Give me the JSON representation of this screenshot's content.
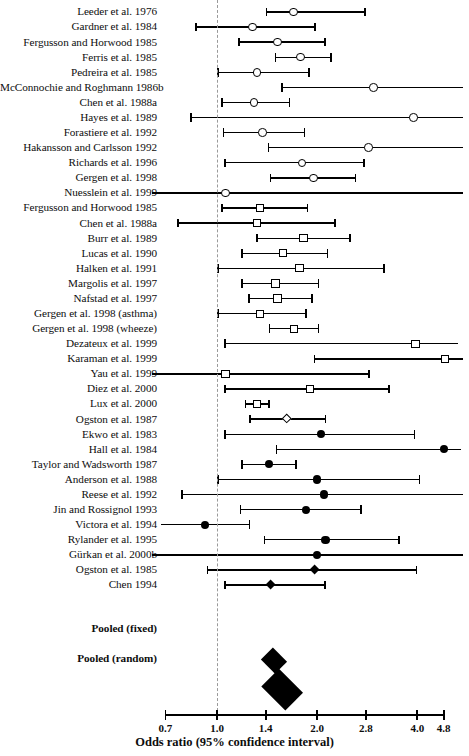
{
  "chart_data": {
    "type": "forest",
    "title": "",
    "xlabel": "Odds ratio (95% confidence interval)",
    "ylabel": "",
    "scale": "log",
    "xlim": [
      0.7,
      4.8
    ],
    "null_value": 1.0,
    "grid": false,
    "legend": "none",
    "tick_labels": [
      "0.7",
      "1.0",
      "1.4",
      "2.0",
      "2.8",
      "4.0",
      "4.8"
    ],
    "tick_values": [
      0.7,
      1.0,
      1.4,
      2.0,
      2.8,
      4.0,
      4.8
    ],
    "marker_shapes": {
      "open-circle": "group 1 studies",
      "open-square": "group 2 studies",
      "open-diamond": "group 3 studies",
      "filled-circle": "group 4 studies",
      "filled-diamond": "group 5 studies"
    },
    "studies": [
      {
        "label": "Leeder et al. 1976",
        "or": 1.7,
        "lo": 1.4,
        "hi": 2.8,
        "marker": "open-circle",
        "lo_clipped": false,
        "hi_clipped": false
      },
      {
        "label": "Gardner et al. 1984",
        "or": 1.28,
        "lo": 0.86,
        "hi": 1.98,
        "marker": "open-circle",
        "lo_clipped": false,
        "hi_clipped": false
      },
      {
        "label": "Fergusson and Horwood 1985",
        "or": 1.52,
        "lo": 1.16,
        "hi": 2.12,
        "marker": "open-circle",
        "lo_clipped": false,
        "hi_clipped": false
      },
      {
        "label": "Ferris et al. 1985",
        "or": 1.78,
        "lo": 1.49,
        "hi": 2.21,
        "marker": "open-circle",
        "lo_clipped": false,
        "hi_clipped": false
      },
      {
        "label": "Pedreira et al. 1985",
        "or": 1.32,
        "lo": 1.0,
        "hi": 1.9,
        "marker": "open-circle",
        "lo_clipped": false,
        "hi_clipped": false
      },
      {
        "label": "McConnochie and Roghmann 1986b",
        "or": 2.95,
        "lo": 1.56,
        "hi": 5.5,
        "marker": "open-circle",
        "lo_clipped": false,
        "hi_clipped": true
      },
      {
        "label": "Chen et al. 1988a",
        "or": 1.29,
        "lo": 1.03,
        "hi": 1.66,
        "marker": "open-circle",
        "lo_clipped": false,
        "hi_clipped": false
      },
      {
        "label": "Hayes et al. 1989",
        "or": 3.9,
        "lo": 0.83,
        "hi": 5.5,
        "marker": "open-circle",
        "lo_clipped": false,
        "hi_clipped": true
      },
      {
        "label": "Forastiere et al. 1992",
        "or": 1.37,
        "lo": 1.04,
        "hi": 1.84,
        "marker": "open-circle",
        "lo_clipped": false,
        "hi_clipped": false
      },
      {
        "label": "Hakansson and Carlsson 1992",
        "or": 2.85,
        "lo": 1.42,
        "hi": 5.5,
        "marker": "open-circle",
        "lo_clipped": false,
        "hi_clipped": true
      },
      {
        "label": "Richards et al. 1996",
        "or": 1.8,
        "lo": 1.05,
        "hi": 2.78,
        "marker": "open-circle",
        "lo_clipped": false,
        "hi_clipped": false
      },
      {
        "label": "Gergen et al. 1998",
        "or": 1.95,
        "lo": 1.44,
        "hi": 2.62,
        "marker": "open-circle",
        "lo_clipped": false,
        "hi_clipped": false
      },
      {
        "label": "Nuesslein et al. 1999",
        "or": 1.06,
        "lo": 0.55,
        "hi": 5.5,
        "marker": "open-circle",
        "lo_clipped": true,
        "hi_clipped": true
      },
      {
        "label": "Fergusson and Horwood 1985",
        "or": 1.35,
        "lo": 1.03,
        "hi": 1.88,
        "marker": "open-square",
        "lo_clipped": false,
        "hi_clipped": false
      },
      {
        "label": "Chen et al. 1988a",
        "or": 1.32,
        "lo": 0.76,
        "hi": 2.28,
        "marker": "open-square",
        "lo_clipped": false,
        "hi_clipped": false
      },
      {
        "label": "Burr et al. 1989",
        "or": 1.82,
        "lo": 1.31,
        "hi": 2.52,
        "marker": "open-square",
        "lo_clipped": false,
        "hi_clipped": false
      },
      {
        "label": "Lucas et al. 1990",
        "or": 1.58,
        "lo": 1.18,
        "hi": 2.16,
        "marker": "open-square",
        "lo_clipped": false,
        "hi_clipped": false
      },
      {
        "label": "Halken et al. 1991",
        "or": 1.77,
        "lo": 1.0,
        "hi": 3.2,
        "marker": "open-square",
        "lo_clipped": false,
        "hi_clipped": false
      },
      {
        "label": "Margolis et al. 1997",
        "or": 1.5,
        "lo": 1.18,
        "hi": 2.03,
        "marker": "open-square",
        "lo_clipped": false,
        "hi_clipped": false
      },
      {
        "label": "Nafstad et al. 1997",
        "or": 1.52,
        "lo": 1.24,
        "hi": 1.94,
        "marker": "open-square",
        "lo_clipped": false,
        "hi_clipped": false
      },
      {
        "label": "Gergen et al. 1998 (asthma)",
        "or": 1.35,
        "lo": 1.0,
        "hi": 1.86,
        "marker": "open-square",
        "lo_clipped": false,
        "hi_clipped": false
      },
      {
        "label": "Gergen et al. 1998 (wheeze)",
        "or": 1.7,
        "lo": 1.43,
        "hi": 2.03,
        "marker": "open-square",
        "lo_clipped": false,
        "hi_clipped": false
      },
      {
        "label": "Dezateux et al. 1999",
        "or": 3.95,
        "lo": 1.05,
        "hi": 5.3,
        "marker": "open-square",
        "lo_clipped": false,
        "hi_clipped": true
      },
      {
        "label": "Karaman et al. 1999",
        "or": 4.85,
        "lo": 1.95,
        "hi": 5.5,
        "marker": "open-square",
        "lo_clipped": false,
        "hi_clipped": true
      },
      {
        "label": "Yau et al. 1999",
        "or": 1.06,
        "lo": 0.55,
        "hi": 2.88,
        "marker": "open-square",
        "lo_clipped": true,
        "hi_clipped": false
      },
      {
        "label": "Diez et al. 2000",
        "or": 1.9,
        "lo": 1.05,
        "hi": 3.3,
        "marker": "open-square",
        "lo_clipped": false,
        "hi_clipped": false
      },
      {
        "label": "Lux et al. 2000",
        "or": 1.32,
        "lo": 1.21,
        "hi": 1.44,
        "marker": "open-square",
        "lo_clipped": false,
        "hi_clipped": false
      },
      {
        "label": "Ogston et al. 1987",
        "or": 1.62,
        "lo": 1.25,
        "hi": 2.13,
        "marker": "open-diamond",
        "lo_clipped": false,
        "hi_clipped": false
      },
      {
        "label": "Ekwo et al. 1983",
        "or": 2.05,
        "lo": 1.05,
        "hi": 3.95,
        "marker": "filled-circle",
        "lo_clipped": false,
        "hi_clipped": false
      },
      {
        "label": "Hall et al. 1984",
        "or": 4.8,
        "lo": 1.5,
        "hi": 5.4,
        "marker": "filled-circle",
        "lo_clipped": false,
        "hi_clipped": true
      },
      {
        "label": "Taylor and Wadsworth 1987",
        "or": 1.43,
        "lo": 1.18,
        "hi": 1.74,
        "marker": "filled-circle",
        "lo_clipped": false,
        "hi_clipped": false
      },
      {
        "label": "Anderson et al. 1988",
        "or": 2.0,
        "lo": 1.0,
        "hi": 4.08,
        "marker": "filled-circle",
        "lo_clipped": false,
        "hi_clipped": false
      },
      {
        "label": "Reese et al. 1992",
        "or": 2.1,
        "lo": 0.78,
        "hi": 5.5,
        "marker": "filled-circle",
        "lo_clipped": false,
        "hi_clipped": true
      },
      {
        "label": "Jin and Rossignol 1993",
        "or": 1.85,
        "lo": 1.17,
        "hi": 2.72,
        "marker": "filled-circle",
        "lo_clipped": false,
        "hi_clipped": false
      },
      {
        "label": "Victora et al. 1994",
        "or": 0.92,
        "lo": 0.68,
        "hi": 1.26,
        "marker": "filled-circle",
        "lo_clipped": true,
        "hi_clipped": false
      },
      {
        "label": "Rylander et al. 1995",
        "or": 2.12,
        "lo": 1.38,
        "hi": 3.55,
        "marker": "filled-circle",
        "lo_clipped": false,
        "hi_clipped": false
      },
      {
        "label": "Gürkan et al. 2000b",
        "or": 2.0,
        "lo": 0.55,
        "hi": 5.5,
        "marker": "filled-circle",
        "lo_clipped": true,
        "hi_clipped": true
      },
      {
        "label": "Ogston et al. 1985",
        "or": 1.97,
        "lo": 0.93,
        "hi": 4.0,
        "marker": "filled-diamond",
        "lo_clipped": false,
        "hi_clipped": false
      },
      {
        "label": "Chen 1994",
        "or": 1.45,
        "lo": 1.05,
        "hi": 2.12,
        "marker": "filled-diamond",
        "lo_clipped": false,
        "hi_clipped": false
      }
    ],
    "pooled": [
      {
        "label": "Pooled (fixed)",
        "or": 1.48,
        "lo": 1.42,
        "hi": 1.55,
        "marker": "filled-diamond",
        "width_px": 28,
        "height_px": 24
      },
      {
        "label": "Pooled (random)",
        "or": 1.57,
        "lo": 1.42,
        "hi": 1.74,
        "marker": "filled-diamond",
        "width_px": 48,
        "height_px": 36
      }
    ]
  }
}
